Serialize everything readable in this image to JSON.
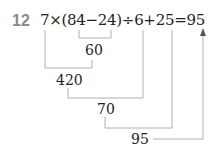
{
  "problem": {
    "number": "12",
    "expression": "7×(84−24)÷6+25=95"
  },
  "steps": [
    {
      "value": "60"
    },
    {
      "value": "420"
    },
    {
      "value": "70"
    },
    {
      "value": "95"
    }
  ],
  "colors": {
    "number": "#8a8a8a",
    "lines": "#b0b0b0",
    "text": "#222222"
  }
}
